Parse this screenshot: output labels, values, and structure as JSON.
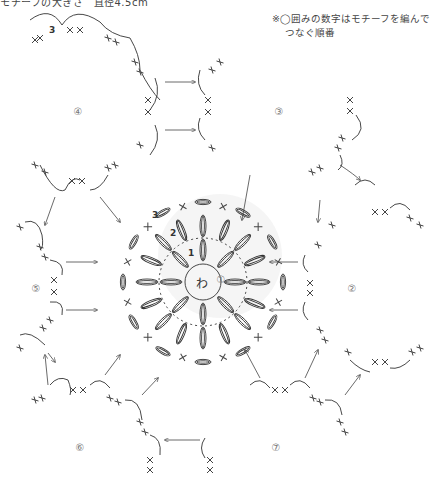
{
  "header": {
    "size_text": "モチーフの大きさ　直径4.5cm"
  },
  "note": {
    "line1": "※◯囲みの数字はモチーフを編んで",
    "line2": "つなぐ順番"
  },
  "motifs": [
    {
      "label": "①",
      "x": 221,
      "y": 280
    },
    {
      "label": "②",
      "x": 352,
      "y": 289
    },
    {
      "label": "③",
      "x": 279,
      "y": 112
    },
    {
      "label": "④",
      "x": 78,
      "y": 112
    },
    {
      "label": "⑤",
      "x": 36,
      "y": 289
    },
    {
      "label": "⑥",
      "x": 80,
      "y": 448
    },
    {
      "label": "⑦",
      "x": 276,
      "y": 448
    }
  ],
  "center": {
    "ring_label": "わ",
    "round_labels": [
      "1",
      "2",
      "3"
    ]
  },
  "colors": {
    "line": "#333333",
    "shade": "#ececec",
    "text": "#444444"
  }
}
